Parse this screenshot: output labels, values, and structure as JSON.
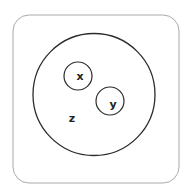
{
  "diagram": {
    "type": "euler",
    "colors": {
      "frame_stroke": "#aaaaaa",
      "circle_stroke": "#2b2b2b",
      "label": "#222222",
      "background": "#ffffff"
    },
    "frame": {
      "shape": "rounded-rect",
      "x": 13,
      "y": 15,
      "width": 166,
      "height": 168,
      "radius": 16
    },
    "sets": [
      {
        "id": "z",
        "label": "z",
        "cx": 94,
        "cy": 94.5,
        "r": 61,
        "label_x": 72,
        "label_y": 118
      },
      {
        "id": "x",
        "label": "x",
        "cx": 78,
        "cy": 76,
        "r": 14,
        "label_x": 80,
        "label_y": 76
      },
      {
        "id": "y",
        "label": "y",
        "cx": 110,
        "cy": 101,
        "r": 14,
        "label_x": 113,
        "label_y": 104
      }
    ],
    "relations": [
      "x is a subset of z",
      "y is a subset of z",
      "x and y are disjoint"
    ]
  }
}
